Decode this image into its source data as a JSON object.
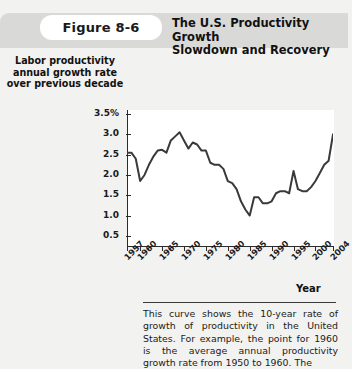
{
  "header": {
    "figure_label": "Figure  8-6",
    "title_line1": "The U.S. Productivity Growth",
    "title_line2": "Slowdown and Recovery"
  },
  "axes": {
    "y_title_line1": "Labor productivity",
    "y_title_line2": "annual growth rate",
    "y_title_line3": "over previous decade",
    "x_title": "Year"
  },
  "caption": {
    "text": "This curve shows the 10-year rate of growth of productivity in the United States. For example, the point for 1960 is the average annual productivity growth rate from 1950 to 1960. The"
  },
  "chart_data": {
    "type": "line",
    "title": "The U.S. Productivity Growth Slowdown and Recovery",
    "xlabel": "Year",
    "ylabel": "Labor productivity annual growth rate over previous decade",
    "xlim": [
      1957,
      2004
    ],
    "ylim": [
      0.25,
      3.6
    ],
    "grid": false,
    "legend": "none",
    "line_color": "#3a3a3a",
    "y_ticks": [
      "3.5%",
      "3.0",
      "2.5",
      "2.0",
      "1.5",
      "1.0",
      "0.5"
    ],
    "y_tick_values": [
      3.5,
      3.0,
      2.5,
      2.0,
      1.5,
      1.0,
      0.5
    ],
    "x_ticks": [
      "1957",
      "1960",
      "1965",
      "1970",
      "1975",
      "1980",
      "1985",
      "1990",
      "1995",
      "2000",
      "2004"
    ],
    "x_tick_values": [
      1957,
      1960,
      1965,
      1970,
      1975,
      1980,
      1985,
      1990,
      1995,
      2000,
      2004
    ],
    "x": [
      1957,
      1958,
      1959,
      1960,
      1961,
      1962,
      1963,
      1964,
      1965,
      1966,
      1967,
      1968,
      1969,
      1970,
      1971,
      1972,
      1973,
      1974,
      1975,
      1976,
      1977,
      1978,
      1979,
      1980,
      1981,
      1982,
      1983,
      1984,
      1985,
      1986,
      1987,
      1988,
      1989,
      1990,
      1991,
      1992,
      1993,
      1994,
      1995,
      1996,
      1997,
      1998,
      1999,
      2000,
      2001,
      2002,
      2003,
      2004
    ],
    "values": [
      2.55,
      2.55,
      2.4,
      1.85,
      2.0,
      2.25,
      2.45,
      2.6,
      2.62,
      2.55,
      2.85,
      2.95,
      3.05,
      2.85,
      2.65,
      2.8,
      2.75,
      2.6,
      2.6,
      2.3,
      2.25,
      2.25,
      2.15,
      1.85,
      1.8,
      1.65,
      1.35,
      1.15,
      1.0,
      1.45,
      1.45,
      1.3,
      1.3,
      1.35,
      1.55,
      1.6,
      1.6,
      1.55,
      2.1,
      1.65,
      1.6,
      1.6,
      1.7,
      1.85,
      2.05,
      2.25,
      2.35,
      3.0
    ]
  }
}
